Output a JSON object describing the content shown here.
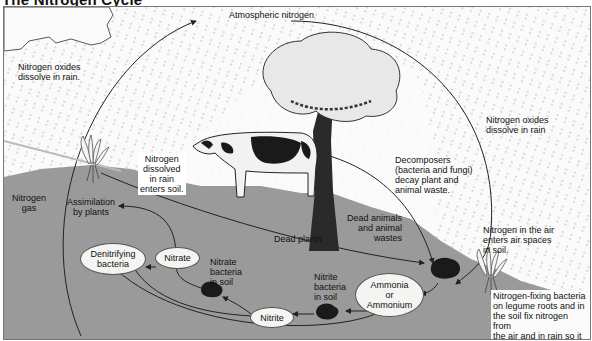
{
  "title": "The Nitrogen Cycle",
  "colors": {
    "sky": "#fafafa",
    "ground": "#9a9a9a",
    "rain": "#9a9a9a",
    "ellipse_fill": "#f4f4f2",
    "arrow": "#222222",
    "bacteria_blob": "#1a1a1a"
  },
  "labels": {
    "atmospheric_nitrogen": "Atmospheric nitrogen",
    "nox_left_1": "Nitrogen oxides",
    "nox_left_2": "dissolve in rain.",
    "nox_right_1": "Nitrogen oxides",
    "nox_right_2": "dissolve in rain",
    "n_dissolved_1": "Nitrogen",
    "n_dissolved_2": "dissolved",
    "n_dissolved_3": "in rain",
    "n_dissolved_4": "enters soil.",
    "nitrogen_gas_1": "Nitrogen",
    "nitrogen_gas_2": "gas",
    "assimilation_1": "Assimilation",
    "assimilation_2": "by plants",
    "decomposers_1": "Decomposers",
    "decomposers_2": "(bacteria and fungi)",
    "decomposers_3": "decay plant and",
    "decomposers_4": "animal waste.",
    "dead_animals_1": "Dead animals",
    "dead_animals_2": "and animal",
    "dead_animals_3": "wastes",
    "dead_plants": "Dead plants",
    "n_air_1": "Nitrogen in the air",
    "n_air_2": "enters air spaces",
    "n_air_3": "in soil.",
    "nitrate_bacteria_1": "Nitrate",
    "nitrate_bacteria_2": "bacteria",
    "nitrate_bacteria_3": "in soil",
    "nitrite_bacteria_1": "Nitrite",
    "nitrite_bacteria_2": "bacteria",
    "nitrite_bacteria_3": "in soil",
    "fixing_1": "Nitrogen-fixing bacteria",
    "fixing_2": "on legume roots and in",
    "fixing_3": "the soil fix nitrogen from",
    "fixing_4": "the air and in rain so it",
    "fixing_5": "can be used by plants."
  },
  "nodes": {
    "denitrifying_1": "Denitrifying",
    "denitrifying_2": "bacteria",
    "nitrate": "Nitrate",
    "nitrite": "Nitrite",
    "ammonia_1": "Ammonia",
    "ammonia_2": "or",
    "ammonia_3": "Ammonium"
  },
  "illustrations": [
    "cloud",
    "tree",
    "cow",
    "plant-left",
    "plant-right",
    "bacteria-blob-decomposer",
    "bacteria-blob-nitrate",
    "bacteria-blob-nitrite"
  ]
}
